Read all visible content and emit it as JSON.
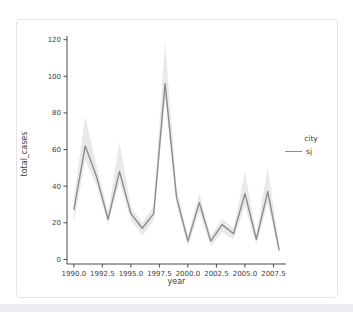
{
  "chart_data": {
    "type": "line",
    "title": "",
    "xlabel": "year",
    "ylabel": "total_cases",
    "x": [
      1990,
      1991,
      1992,
      1993,
      1994,
      1995,
      1996,
      1997,
      1998,
      1999,
      2000,
      2001,
      2002,
      2003,
      2004,
      2005,
      2006,
      2007,
      2008
    ],
    "series": [
      {
        "name": "sj",
        "values": [
          27,
          62,
          45,
          22,
          48,
          25,
          17,
          25,
          96,
          34,
          10,
          31,
          10,
          19,
          14,
          36,
          11,
          37,
          5
        ],
        "ci_lower": [
          20,
          54,
          40,
          19,
          42,
          21,
          13,
          21,
          88,
          30,
          7,
          26,
          7,
          15,
          11,
          29,
          8,
          31,
          3
        ],
        "ci_upper": [
          34,
          78,
          51,
          26,
          64,
          29,
          20,
          29,
          119,
          39,
          13,
          36,
          13,
          22,
          17,
          48,
          14,
          50,
          8
        ],
        "color": "#8a8c91"
      }
    ],
    "band_color": "#9a9ba1",
    "band_opacity": 0.22,
    "axis_color": "#4a4a4a",
    "tick_text_color": "#3d3d3d",
    "xlim": [
      1989.4,
      2008.6
    ],
    "ylim": [
      -2.5,
      122
    ],
    "xticks": [
      1990.0,
      1992.5,
      1995.0,
      1997.5,
      2000.0,
      2002.5,
      2005.0,
      2007.5
    ],
    "xtick_labels": [
      "1990.0",
      "1992.5",
      "1995.0",
      "1997.5",
      "2000.0",
      "2002.5",
      "2005.0",
      "2007.5"
    ],
    "yticks": [
      0,
      20,
      40,
      60,
      80,
      100,
      120
    ],
    "ytick_labels": [
      "0",
      "20",
      "40",
      "60",
      "80",
      "100",
      "120"
    ],
    "grid": false,
    "legend": {
      "title": "city",
      "position": "right-outside"
    }
  }
}
